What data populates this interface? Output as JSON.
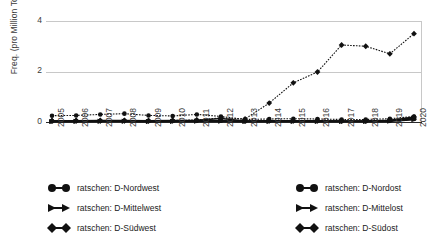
{
  "axes": {
    "ylabel": "Freq. (pro Million Tokens)",
    "yticks": [
      "0",
      "2",
      "4"
    ],
    "xticks": [
      "2005",
      "2006",
      "2007",
      "2008",
      "2009",
      "2010",
      "2011",
      "2012",
      "2013",
      "2014",
      "2015",
      "2016",
      "2017",
      "2018",
      "2019",
      "2020"
    ]
  },
  "legend": {
    "left": [
      {
        "label": "ratschen: D-Nordwest",
        "marker": "circle"
      },
      {
        "label": "ratschen: D-Mittelwest",
        "marker": "tri"
      },
      {
        "label": "ratschen: D-Südwest",
        "marker": "diamond"
      }
    ],
    "right": [
      {
        "label": "ratschen: D-Nordost",
        "marker": "circle"
      },
      {
        "label": "ratschen: D-Mittelost",
        "marker": "tri"
      },
      {
        "label": "ratschen: D-Südost",
        "marker": "diamond"
      }
    ]
  },
  "chart_data": {
    "type": "line",
    "title": "",
    "xlabel": "",
    "ylabel": "Freq. (pro Million Tokens)",
    "grid": true,
    "legend_position": "bottom",
    "ylim": [
      0,
      4
    ],
    "yticks": [
      0,
      2,
      4
    ],
    "categories": [
      2005,
      2006,
      2007,
      2008,
      2009,
      2010,
      2011,
      2012,
      2013,
      2014,
      2015,
      2016,
      2017,
      2018,
      2019,
      2020
    ],
    "series": [
      {
        "name": "ratschen: D-Nordwest",
        "marker": "circle",
        "linestyle": "dotted",
        "values": [
          0.25,
          0.26,
          0.3,
          0.33,
          0.26,
          0.24,
          0.3,
          0.22,
          0.1,
          0.12,
          0.13,
          0.12,
          0.1,
          0.1,
          0.13,
          0.22
        ]
      },
      {
        "name": "ratschen: D-Mittelwest",
        "marker": "tri",
        "linestyle": "solid",
        "values": [
          0.02,
          0.03,
          0.03,
          0.03,
          0.02,
          0.03,
          0.04,
          0.04,
          0.03,
          0.03,
          0.03,
          0.03,
          0.03,
          0.03,
          0.05,
          0.16
        ]
      },
      {
        "name": "ratschen: D-Südwest",
        "marker": "diamond",
        "linestyle": "solid",
        "values": [
          0.05,
          0.05,
          0.06,
          0.06,
          0.05,
          0.06,
          0.07,
          0.14,
          0.04,
          0.05,
          0.05,
          0.05,
          0.04,
          0.04,
          0.07,
          0.2
        ]
      },
      {
        "name": "ratschen: D-Nordost",
        "marker": "circle",
        "linestyle": "solid",
        "values": [
          0.03,
          0.04,
          0.04,
          0.05,
          0.04,
          0.04,
          0.05,
          0.05,
          0.03,
          0.04,
          0.04,
          0.04,
          0.03,
          0.03,
          0.05,
          0.12
        ]
      },
      {
        "name": "ratschen: D-Mittelost",
        "marker": "tri",
        "linestyle": "solid",
        "values": [
          0.02,
          0.02,
          0.03,
          0.03,
          0.02,
          0.02,
          0.03,
          0.03,
          0.02,
          0.02,
          0.02,
          0.02,
          0.02,
          0.02,
          0.03,
          0.09
        ]
      },
      {
        "name": "ratschen: D-Südost",
        "marker": "diamond",
        "linestyle": "dotted",
        "values": [
          0.05,
          0.06,
          0.05,
          0.05,
          0.05,
          0.06,
          0.08,
          0.16,
          0.12,
          0.75,
          1.55,
          1.98,
          3.05,
          3.0,
          2.7,
          3.5
        ]
      }
    ]
  }
}
